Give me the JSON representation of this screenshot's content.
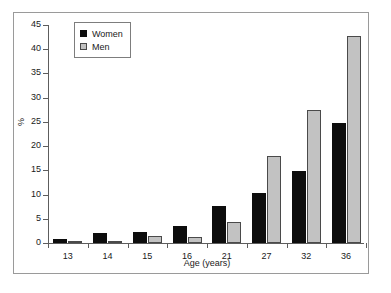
{
  "chart_data": {
    "type": "bar",
    "title": "",
    "xlabel": "Age (years)",
    "ylabel": "%",
    "categories": [
      "13",
      "14",
      "15",
      "16",
      "21",
      "27",
      "32",
      "36"
    ],
    "series": [
      {
        "name": "Women",
        "color": "#0d0d0d",
        "values": [
          0.9,
          2.1,
          2.2,
          3.6,
          7.6,
          10.3,
          14.8,
          24.7
        ]
      },
      {
        "name": "Men",
        "color": "#c2c2c2",
        "values": [
          0.3,
          0.3,
          1.5,
          1.3,
          4.4,
          17.9,
          27.4,
          42.8
        ]
      }
    ],
    "ylim": [
      0,
      45
    ],
    "ytick_step": 5,
    "yticks": [
      "0",
      "5",
      "10",
      "15",
      "20",
      "25",
      "30",
      "35",
      "40",
      "45"
    ],
    "grid": false,
    "legend_position": "top-left"
  },
  "legend": {
    "items": [
      {
        "label": "Women",
        "swatch": "women"
      },
      {
        "label": "Men",
        "swatch": "men"
      }
    ]
  },
  "axes": {
    "y_title": "%",
    "x_title": "Age (years)"
  }
}
